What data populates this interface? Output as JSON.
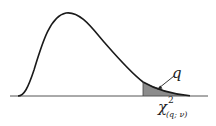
{
  "diagram": {
    "title": "",
    "curve": "chi-square probability density function",
    "shaded_region": "upper tail area q",
    "labels": {
      "q": "q",
      "chi_symbol": "χ",
      "chi_superscript": "2",
      "chi_subscript": "(q; ν)"
    },
    "colors": {
      "curve": "#1a1a1a",
      "axis": "#555555",
      "shade": "#8c8c8c",
      "background": "#ffffff"
    }
  }
}
